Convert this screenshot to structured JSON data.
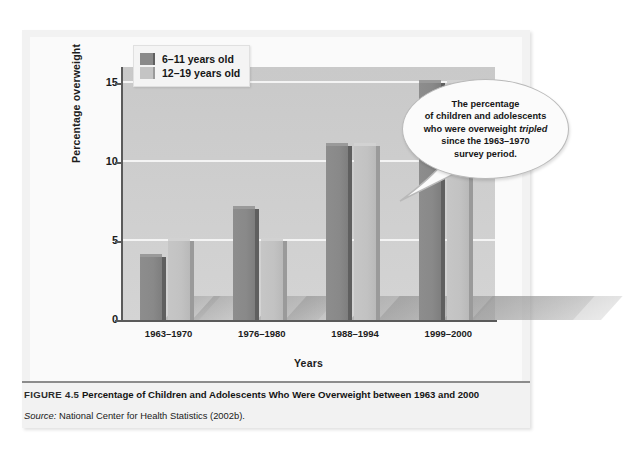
{
  "figure": {
    "number": "FIGURE 4.5",
    "caption": "Percentage of Children and Adolescents Who Were Overweight between 1963 and 2000",
    "source_label": "Source:",
    "source_text": "National Center for Health Statistics (2002b)."
  },
  "callout": {
    "line1": "The percentage",
    "line2": "of children and adolescents",
    "line3_a": "who were overweight ",
    "line3_italic": "tripled",
    "line4": "since the 1963–1970",
    "line5": "survey period."
  },
  "chart_data": {
    "type": "bar",
    "title": "",
    "xlabel": "Years",
    "ylabel": "Percentage overweight",
    "categories": [
      "1963–1970",
      "1976–1980",
      "1988–1994",
      "1999–2000"
    ],
    "series": [
      {
        "name": "6–11 years old",
        "values": [
          4,
          7,
          11,
          15
        ],
        "color": "#8a8a8a"
      },
      {
        "name": "12–19 years old",
        "values": [
          5,
          5,
          11,
          15
        ],
        "color": "#c4c4c4"
      }
    ],
    "ylim": [
      0,
      16
    ],
    "yticks": [
      0,
      5,
      10,
      15
    ],
    "ytick_labels": [
      "0",
      "5",
      "10",
      "15"
    ],
    "grid": true,
    "legend_position": "top-left",
    "plot_background": "#cfcfcf"
  }
}
